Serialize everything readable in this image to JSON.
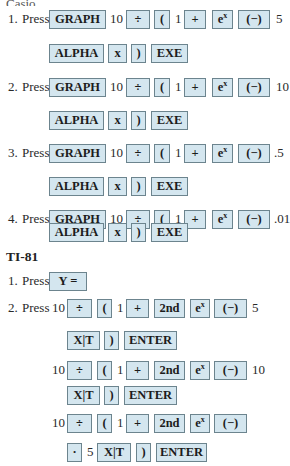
{
  "casio": {
    "heading_cut": "Casio",
    "steps": [
      {
        "number": "1.",
        "verb": "Press",
        "arg": "5"
      },
      {
        "number": "2.",
        "verb": "Press",
        "arg": "10"
      },
      {
        "number": "3.",
        "verb": "Press",
        "arg": ".5"
      },
      {
        "number": "4.",
        "verb": "Press",
        "arg": ".01"
      }
    ],
    "keys": {
      "graph": "GRAPH",
      "divide": "÷",
      "lparen": "(",
      "plus": "+",
      "ex_base": "e",
      "ex_sup": "x",
      "neg": "(−)",
      "alpha": "ALPHA",
      "x": "x",
      "rparen": ")",
      "exe": "EXE"
    },
    "literals": {
      "ten": "10",
      "one": "1"
    }
  },
  "ti81": {
    "heading": "TI-81",
    "step1": {
      "number": "1.",
      "verb": "Press"
    },
    "step2": {
      "number": "2.",
      "verb": "Press"
    },
    "keys": {
      "y_equals": "Y =",
      "divide": "÷",
      "lparen": "(",
      "plus": "+",
      "second": "2nd",
      "ex_base": "e",
      "ex_sup": "x",
      "neg": "(−)",
      "xt": "X|T",
      "rparen": ")",
      "enter": "ENTER",
      "decimal": "·"
    },
    "literals": {
      "ten": "10",
      "one": "1",
      "five": "5"
    },
    "args": [
      "5",
      "10",
      "",
      "5"
    ]
  }
}
